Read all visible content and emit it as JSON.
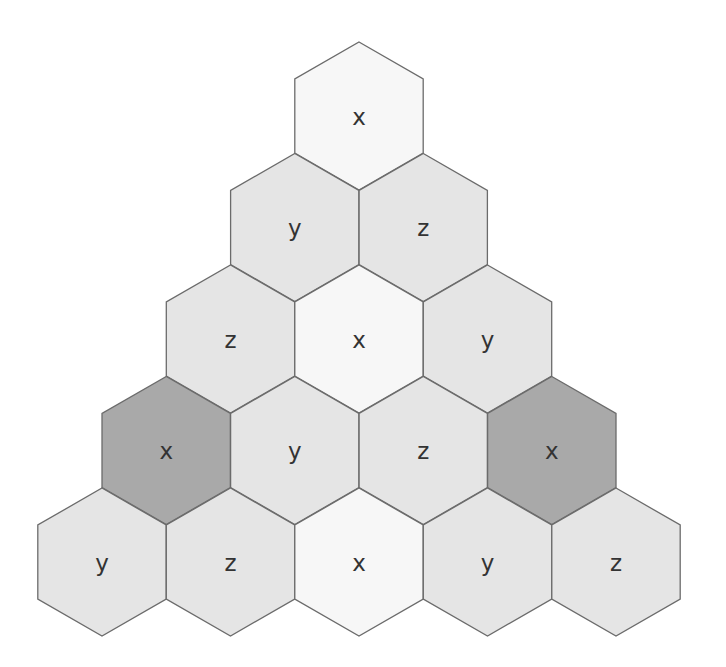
{
  "diagram": {
    "type": "hexagonal triangle grid",
    "colors": {
      "light": "#e5e5e5",
      "white": "#f7f7f7",
      "dark": "#a9a9a9",
      "stroke": "#6b6b6b",
      "text": "#333333"
    },
    "rows": [
      [
        {
          "label": "x",
          "fill": "white"
        }
      ],
      [
        {
          "label": "y",
          "fill": "light"
        },
        {
          "label": "z",
          "fill": "light"
        }
      ],
      [
        {
          "label": "z",
          "fill": "light"
        },
        {
          "label": "x",
          "fill": "white"
        },
        {
          "label": "y",
          "fill": "light"
        }
      ],
      [
        {
          "label": "x",
          "fill": "dark"
        },
        {
          "label": "y",
          "fill": "light"
        },
        {
          "label": "z",
          "fill": "light"
        },
        {
          "label": "x",
          "fill": "dark"
        }
      ],
      [
        {
          "label": "y",
          "fill": "light"
        },
        {
          "label": "z",
          "fill": "light"
        },
        {
          "label": "x",
          "fill": "white"
        },
        {
          "label": "y",
          "fill": "light"
        },
        {
          "label": "z",
          "fill": "light"
        }
      ]
    ]
  }
}
